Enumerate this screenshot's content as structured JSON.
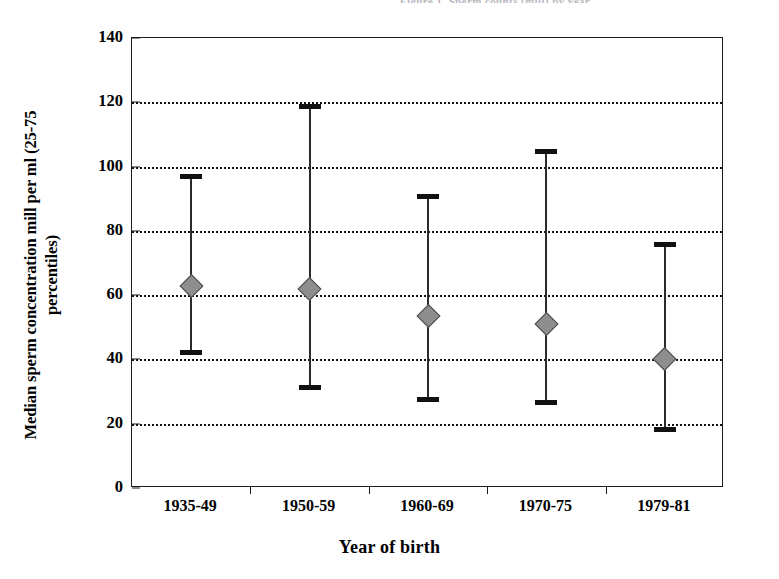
{
  "top_caption": "Figure 1. Sperm counts (mill) by year",
  "axis": {
    "y_title_line1": "Median sperm concentration mill per ml (25-75",
    "y_title_line2": "percentiles)",
    "x_title": "Year of birth"
  },
  "colors": {
    "marker_fill": "#8e8e8e",
    "marker_edge": "#4a4a4a",
    "line": "#2b2b2b",
    "axis": "#1a1a1a",
    "grid": "#111111",
    "background": "#ffffff"
  },
  "chart_data": {
    "type": "scatter",
    "title": "",
    "xlabel": "Year of birth",
    "ylabel": "Median sperm concentration mill per ml (25-75 percentiles)",
    "categories": [
      "1935-49",
      "1950-59",
      "1960-69",
      "1970-75",
      "1979-81"
    ],
    "values": [
      63,
      62,
      53.5,
      51,
      40
    ],
    "error_low": [
      42,
      31,
      27.5,
      26.5,
      18
    ],
    "error_high": [
      97,
      119,
      91,
      105,
      76
    ],
    "ylim": [
      0,
      140
    ],
    "yticks": [
      0,
      20,
      40,
      60,
      80,
      100,
      120,
      140
    ],
    "ytick_labels": [
      "0",
      "20",
      "40",
      "60",
      "80",
      "100",
      "120",
      "140"
    ],
    "grid": true,
    "grid_style": "dotted-horizontal",
    "legend": null,
    "marker": "diamond",
    "error_bar_caps": true,
    "series": [
      {
        "name": "Median sperm concentration",
        "points": [
          {
            "category": "1935-49",
            "median": 63,
            "p25": 42,
            "p75": 97
          },
          {
            "category": "1950-59",
            "median": 62,
            "p25": 31,
            "p75": 119
          },
          {
            "category": "1960-69",
            "median": 53.5,
            "p25": 27.5,
            "p75": 91
          },
          {
            "category": "1970-75",
            "median": 51,
            "p25": 26.5,
            "p75": 105
          },
          {
            "category": "1979-81",
            "median": 40,
            "p25": 18,
            "p75": 76
          }
        ]
      }
    ]
  }
}
